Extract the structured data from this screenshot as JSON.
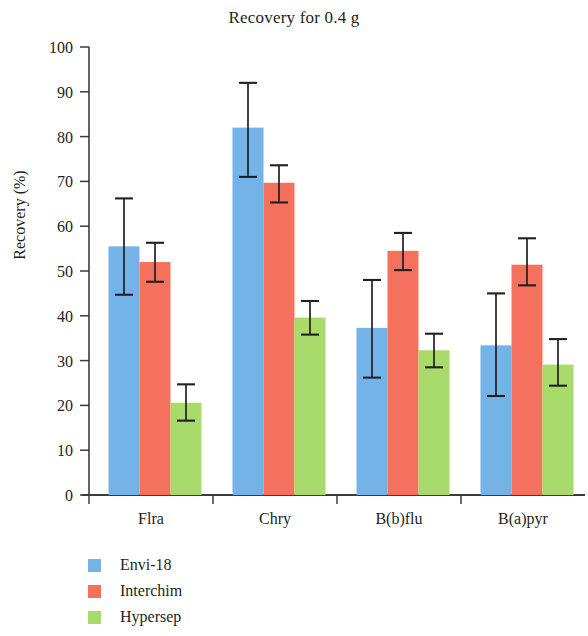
{
  "chart_data": {
    "type": "bar",
    "title": "Recovery for 0.4 g",
    "xlabel": "",
    "ylabel": "Recovery (%)",
    "ylim": [
      0,
      100
    ],
    "yticks": [
      0,
      10,
      20,
      30,
      40,
      50,
      60,
      70,
      80,
      90,
      100
    ],
    "grid": false,
    "legend_position": "below-left",
    "categories": [
      "Flra",
      "Chry",
      "B(b)flu",
      "B(a)pyr"
    ],
    "series": [
      {
        "name": "Envi-18",
        "color": "#74b3e8",
        "values": [
          55.5,
          82.0,
          37.3,
          33.4
        ],
        "errors_upper": [
          66.2,
          92.0,
          48.0,
          45.0
        ],
        "errors_lower": [
          44.7,
          71.0,
          26.2,
          22.1
        ]
      },
      {
        "name": "Interchim",
        "color": "#f4715e",
        "values": [
          52.0,
          69.7,
          54.5,
          51.4
        ],
        "errors_upper": [
          56.3,
          73.6,
          58.5,
          57.3
        ],
        "errors_lower": [
          47.6,
          65.3,
          50.2,
          46.8
        ]
      },
      {
        "name": "Hypersep",
        "color": "#a8db6b",
        "values": [
          20.6,
          39.6,
          32.3,
          29.1
        ],
        "errors_upper": [
          24.7,
          43.3,
          36.0,
          34.8
        ],
        "errors_lower": [
          16.6,
          35.8,
          28.5,
          24.4
        ]
      }
    ]
  },
  "axis": {
    "tick_labels": [
      "100",
      "90",
      "80",
      "70",
      "60",
      "50",
      "40",
      "30",
      "20",
      "10",
      "0"
    ],
    "category_labels": [
      "Flra",
      "Chry",
      "B(b)flu",
      "B(a)pyr"
    ]
  },
  "legend": {
    "items": [
      {
        "label": "Envi-18",
        "color": "#74b3e8"
      },
      {
        "label": "Interchim",
        "color": "#f4715e"
      },
      {
        "label": "Hypersep",
        "color": "#a8db6b"
      }
    ]
  }
}
